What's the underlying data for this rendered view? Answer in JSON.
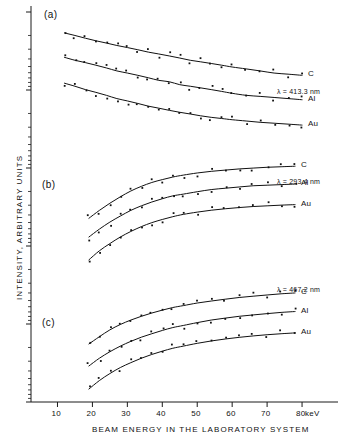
{
  "figure": {
    "axis_color": "#1a1a1a",
    "curve_color": "#111111",
    "point_color": "#111111",
    "x_title": "BEAM  ENERGY   IN  THE  LABORATORY   SYSTEM",
    "y_title": "INTENSITY,  ARBITRARY   UNITS",
    "x_unit": "keV",
    "x_ticks": [
      "10",
      "20",
      "30",
      "40",
      "50",
      "60",
      "70",
      "80"
    ]
  },
  "chart_data": {
    "type": "line",
    "title": "",
    "xlabel": "BEAM  ENERGY   IN  THE  LABORATORY   SYSTEM",
    "ylabel": "INTENSITY,  ARBITRARY   UNITS",
    "x_unit": "keV",
    "xlim": [
      5,
      88
    ],
    "xticks": [
      10,
      20,
      30,
      40,
      50,
      60,
      70,
      80
    ],
    "yscale": "log",
    "ylim_note": "arbitrary logarithmic units, no numeric tick labels",
    "grid": false,
    "legend": "inline labels at right end of each curve",
    "panels": [
      {
        "label": "(a)",
        "wavelength": "λ = 413.3 nm",
        "series": [
          {
            "name": "C",
            "x": [
              12,
              15,
              18,
              21,
              24,
              27,
              30,
              33,
              36,
              39,
              42,
              45,
              48,
              51,
              54,
              57,
              60,
              64,
              68,
              72,
              76,
              80
            ],
            "y": [
              100,
              93,
              86,
              80,
              75,
              70,
              66,
              62,
              58,
              55,
              52,
              49,
              46,
              44,
              42,
              40,
              38,
              36,
              34,
              32,
              31,
              30
            ]
          },
          {
            "name": "Al",
            "x": [
              12,
              15,
              18,
              21,
              24,
              27,
              30,
              33,
              36,
              39,
              42,
              45,
              48,
              51,
              54,
              57,
              60,
              64,
              68,
              72,
              76,
              80
            ],
            "y": [
              50,
              46,
              43,
              40,
              37,
              34,
              32,
              30,
              28,
              26,
              25,
              23,
              22,
              21,
              20,
              19,
              18,
              17,
              16.5,
              16,
              15.5,
              15
            ]
          },
          {
            "name": "Au",
            "x": [
              12,
              15,
              18,
              21,
              24,
              27,
              30,
              33,
              36,
              39,
              42,
              45,
              48,
              51,
              54,
              57,
              60,
              64,
              68,
              72,
              76,
              80
            ],
            "y": [
              24,
              22,
              20,
              18.5,
              17,
              15.5,
              14.5,
              13.5,
              12.5,
              11.8,
              11.1,
              10.5,
              10,
              9.5,
              9.1,
              8.8,
              8.5,
              8.2,
              7.9,
              7.7,
              7.5,
              7.3
            ]
          }
        ]
      },
      {
        "label": "(b)",
        "wavelength": "λ = 293.4 nm",
        "series": [
          {
            "name": "C",
            "x": [
              19,
              22,
              25,
              28,
              31,
              34,
              37,
              40,
              43,
              46,
              50,
              54,
              58,
              62,
              66,
              70,
              74,
              78
            ],
            "y": [
              10,
              14,
              19,
              25,
              32,
              39,
              46,
              52,
              58,
              63,
              69,
              74,
              78,
              82,
              85,
              88,
              90,
              92
            ]
          },
          {
            "name": "Al",
            "x": [
              19,
              22,
              25,
              28,
              31,
              34,
              37,
              40,
              43,
              46,
              50,
              54,
              58,
              62,
              66,
              70,
              74,
              78
            ],
            "y": [
              4.5,
              6.3,
              8.5,
              11,
              14,
              17,
              20,
              23,
              26,
              28,
              31,
              34,
              36,
              38,
              40,
              41,
              42,
              43
            ]
          },
          {
            "name": "Au",
            "x": [
              19,
              22,
              25,
              28,
              31,
              34,
              37,
              40,
              43,
              46,
              50,
              54,
              58,
              62,
              66,
              70,
              74,
              78
            ],
            "y": [
              1.7,
              2.5,
              3.4,
              4.5,
              5.7,
              7.0,
              8.3,
              9.5,
              10.7,
              11.8,
              13.0,
              14.1,
              15.0,
              15.8,
              16.5,
              17.0,
              17.5,
              17.9
            ]
          }
        ]
      },
      {
        "label": "(c)",
        "wavelength": "λ = 467.2 nm",
        "series": [
          {
            "name": "C",
            "x": [
              19,
              22,
              25,
              28,
              31,
              34,
              37,
              40,
              43,
              46,
              50,
              54,
              58,
              62,
              66,
              70,
              74,
              78
            ],
            "y": [
              12,
              16,
              21,
              26,
              31,
              36,
              41,
              46,
              51,
              55,
              61,
              66,
              71,
              76,
              80,
              84,
              88,
              91
            ]
          },
          {
            "name": "Al",
            "x": [
              19,
              22,
              25,
              28,
              31,
              34,
              37,
              40,
              43,
              46,
              50,
              54,
              58,
              62,
              66,
              70,
              74,
              78
            ],
            "y": [
              5,
              6.8,
              8.8,
              11,
              13.3,
              15.7,
              18,
              20.5,
              23,
              25,
              28,
              31,
              33.5,
              36,
              38,
              40,
              42,
              43.5
            ]
          },
          {
            "name": "Au",
            "x": [
              19,
              22,
              25,
              28,
              31,
              34,
              37,
              40,
              43,
              46,
              50,
              54,
              58,
              62,
              66,
              70,
              74,
              78
            ],
            "y": [
              2.0,
              2.8,
              3.7,
              4.7,
              5.7,
              6.8,
              7.9,
              9.0,
              10.1,
              11.0,
              12.3,
              13.5,
              14.6,
              15.6,
              16.5,
              17.3,
              18.0,
              18.6
            ]
          }
        ]
      }
    ]
  }
}
